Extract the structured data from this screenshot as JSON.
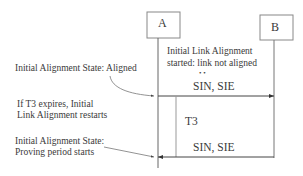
{
  "diagram": {
    "type": "sequence",
    "participants": [
      {
        "id": "A",
        "label": "A"
      },
      {
        "id": "B",
        "label": "B"
      }
    ],
    "note_top": {
      "line1": "Initial Link Alignment",
      "line2": "started: link not aligned",
      "ellipsis": "• •"
    },
    "messages": [
      {
        "from": "A",
        "to": "B",
        "label": "SIN, SIE"
      },
      {
        "from": "B",
        "to": "A",
        "label": "SIN, SIE"
      }
    ],
    "timer": {
      "label": "T3"
    },
    "annotations": [
      {
        "id": "aligned",
        "lines": [
          "Initial Alignment State: Aligned"
        ]
      },
      {
        "id": "t3-expires",
        "lines": [
          "If T3 expires, Initial",
          "Link Alignment restarts"
        ]
      },
      {
        "id": "proving",
        "lines": [
          "Initial Alignment State:",
          "Proving period starts"
        ]
      }
    ],
    "colors": {
      "line": "#555555",
      "box_border": "#777777",
      "text": "#3a3a3a"
    }
  }
}
